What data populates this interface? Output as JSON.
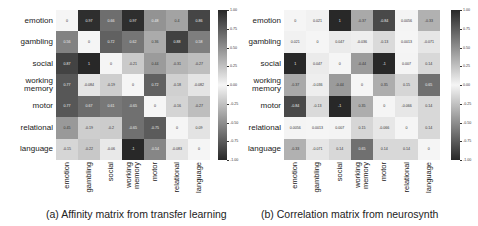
{
  "chart_data": [
    {
      "type": "heatmap",
      "title": "(a) Affinity matrix from transfer learning",
      "rows": [
        "emotion",
        "gambling",
        "social",
        "working memory",
        "motor",
        "relational",
        "language"
      ],
      "columns": [
        "emotion",
        "gambling",
        "social",
        "working memory",
        "motor",
        "relational",
        "language"
      ],
      "values": [
        [
          0,
          0.97,
          0.66,
          0.97,
          0.48,
          0.4,
          0.86
        ],
        [
          0.56,
          0,
          0.72,
          0.62,
          0.36,
          0.88,
          0.58
        ],
        [
          0.87,
          1,
          0,
          -0.21,
          0.44,
          -0.31,
          -0.27
        ],
        [
          0.77,
          -0.084,
          -0.19,
          0,
          0.72,
          -0.18,
          -0.082
        ],
        [
          0.77,
          0.67,
          0.61,
          -0.65,
          0,
          -0.16,
          -0.27
        ],
        [
          0.45,
          -0.19,
          -0.2,
          -0.65,
          -0.75,
          0,
          0.09
        ],
        [
          -0.15,
          -0.22,
          -0.06,
          -1,
          -0.54,
          -0.083,
          0
        ]
      ],
      "colorbar": {
        "min": -1.0,
        "max": 1.0,
        "ticks": [
          "1.00",
          "0.75",
          "0.50",
          "0.25",
          "0.00",
          "-0.25",
          "-0.50",
          "-0.75",
          "-1.00"
        ]
      },
      "colormap": "abs-grey (white at 0, dark at |1|)"
    },
    {
      "type": "heatmap",
      "title": "(b) Correlation matrix from neurosynth",
      "rows": [
        "emotion",
        "gambling",
        "social",
        "working memory",
        "motor",
        "relational",
        "language"
      ],
      "columns": [
        "emotion",
        "gambling",
        "social",
        "working memory",
        "motor",
        "relational",
        "language"
      ],
      "values": [
        [
          0,
          0.021,
          1,
          -0.37,
          -0.84,
          0.0056,
          -0.33
        ],
        [
          0.021,
          0,
          0.047,
          -0.036,
          -0.13,
          0.0013,
          -0.071
        ],
        [
          1,
          0.047,
          0,
          -0.44,
          -1,
          0.007,
          0.14
        ],
        [
          -0.37,
          -0.036,
          -0.44,
          0,
          0.35,
          0.15,
          0.65
        ],
        [
          -0.84,
          -0.13,
          -1,
          0.35,
          0,
          -0.066,
          0.14
        ],
        [
          0.0056,
          0.0013,
          0.007,
          0.15,
          -0.066,
          0,
          0.14
        ],
        [
          -0.33,
          -0.071,
          0.14,
          0.65,
          0.14,
          0.14,
          0
        ]
      ],
      "colorbar": {
        "min": -1.0,
        "max": 1.0,
        "ticks": [
          "1.00",
          "0.75",
          "0.50",
          "0.25",
          "0.00",
          "-0.25",
          "-0.50",
          "-0.75",
          "-1.00"
        ]
      },
      "colormap": "abs-grey (white at 0, dark at |1|)"
    }
  ],
  "captions": {
    "a": "(a) Affinity matrix from transfer learning",
    "b": "(b) Correlation matrix from neurosynth"
  }
}
